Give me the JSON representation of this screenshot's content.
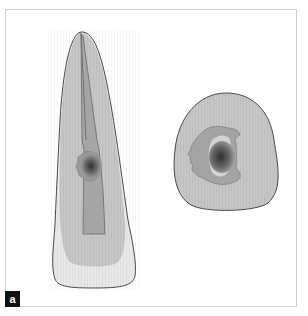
{
  "figure": {
    "panel_label": "a",
    "panels": [
      {
        "name": "longitudinal-section",
        "description": "Tooth in longitudinal section with root canal and dark lesion at mid-root"
      },
      {
        "name": "cross-section",
        "description": "Transverse cross-section of root with irregular canal outline and dark central lesion"
      }
    ],
    "colors": {
      "frame_border": "#cfcfcf",
      "outline": "#4a4a4a",
      "dentin": "#c9c9c9",
      "canal": "#a3a3a3",
      "enamel": "#e6e6e6",
      "lesion": "#3a3a3a",
      "label_bg": "#111111",
      "label_fg": "#ffffff"
    }
  }
}
